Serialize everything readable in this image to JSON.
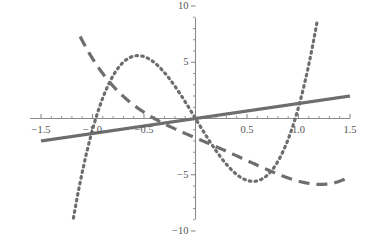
{
  "chart_data": {
    "type": "line",
    "title": "",
    "subtitle": "",
    "xlabel": "",
    "ylabel": "",
    "xlim": [
      -1.5,
      1.5
    ],
    "ylim": [
      -10,
      10
    ],
    "grid": false,
    "legend": "none",
    "axes_style": "crossed-axes-at-origin",
    "x_ticks_major": [
      -1.5,
      -1.0,
      -0.5,
      0.5,
      1.0,
      1.5
    ],
    "x_tick_labels": [
      "-1.5",
      "-1.0",
      "-0.5",
      "0.5",
      "1.0",
      "1.5"
    ],
    "y_ticks_major": [
      -10,
      -5,
      5,
      10
    ],
    "y_tick_labels": [
      "-10",
      "-5",
      "5",
      "10"
    ],
    "x_minor_tick_step": 0.1,
    "y_minor_tick_step": 1,
    "series": [
      {
        "name": "solid-line",
        "style": "solid",
        "color": "#6e6e6e",
        "width": 3.2,
        "expression": "y = 1.333 x",
        "x": [
          -1.5,
          -1.0,
          -0.5,
          0.0,
          0.5,
          1.0,
          1.5
        ],
        "values": [
          -2.0,
          -1.33,
          -0.67,
          0.0,
          0.67,
          1.33,
          2.0
        ]
      },
      {
        "name": "dashed-curve",
        "style": "dashed",
        "color": "#6e6e6e",
        "width": 3.2,
        "expression": "quartic with flat minimum near x = 0.4",
        "x": [
          -1.5,
          -1.3,
          -1.1,
          -0.9,
          -0.7,
          -0.5,
          -0.3,
          -0.1,
          0.1,
          0.3,
          0.5,
          0.7,
          0.9,
          1.1,
          1.3,
          1.5
        ],
        "values": [
          6.5,
          4.8,
          3.2,
          1.9,
          0.9,
          0.1,
          -0.8,
          -1.6,
          -2.0,
          -2.1,
          -2.0,
          -1.6,
          -0.7,
          1.0,
          3.6,
          7.2
        ]
      },
      {
        "name": "dotted-curve",
        "style": "dotted",
        "color": "#6e6e6e",
        "width": 3.2,
        "expression": "cubic: peak (-0.68, 5.1), trough (0.68, -5.4)",
        "x": [
          -1.5,
          -1.3,
          -1.1,
          -0.9,
          -0.7,
          -0.5,
          -0.3,
          -0.1,
          0.1,
          0.3,
          0.5,
          0.7,
          0.9,
          1.1,
          1.3,
          1.5
        ],
        "values": [
          -9.0,
          -3.6,
          0.6,
          3.5,
          5.1,
          4.9,
          3.3,
          1.2,
          -1.2,
          -3.3,
          -4.9,
          -5.4,
          -3.5,
          -0.6,
          3.6,
          9.0
        ]
      }
    ]
  },
  "axis": {
    "x_axis_color": "#8a8a8a",
    "y_axis_color": "#8a8a8a",
    "tick_color": "#8a8a8a",
    "label_color": "#555555"
  }
}
